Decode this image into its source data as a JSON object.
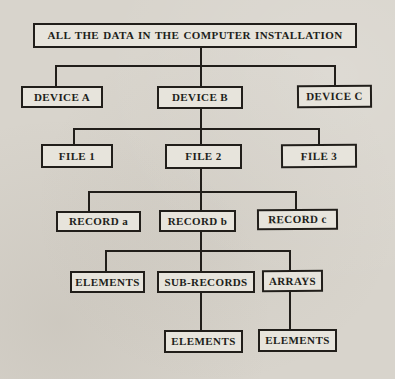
{
  "diagram": {
    "type": "tree",
    "root": {
      "label": "ALL THE DATA IN THE COMPUTER INSTALLATION"
    },
    "devices": [
      {
        "label": "DEVICE A"
      },
      {
        "label": "DEVICE B"
      },
      {
        "label": "DEVICE C"
      }
    ],
    "files": [
      {
        "label": "FILE 1"
      },
      {
        "label": "FILE 2"
      },
      {
        "label": "FILE 3"
      }
    ],
    "records": [
      {
        "label": "RECORD a"
      },
      {
        "label": "RECORD b"
      },
      {
        "label": "RECORD c"
      }
    ],
    "record_b_children": [
      {
        "label": "ELEMENTS"
      },
      {
        "label": "SUB-RECORDS"
      },
      {
        "label": "ARRAYS"
      }
    ],
    "sub_records_child": {
      "label": "ELEMENTS"
    },
    "arrays_child": {
      "label": "ELEMENTS"
    }
  },
  "colors": {
    "paper": "#d8d4cc",
    "box_fill": "#e7e4dc",
    "ink": "#211e1a"
  }
}
